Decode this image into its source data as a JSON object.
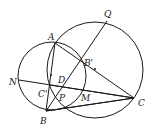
{
  "diagram": {
    "type": "geometry",
    "points": {
      "A": {
        "label": "A",
        "x": 55,
        "y": 43,
        "lx": 48,
        "ly": 40
      },
      "B": {
        "label": "B",
        "x": 46,
        "y": 111,
        "lx": 40,
        "ly": 123
      },
      "C": {
        "label": "C",
        "x": 134,
        "y": 98,
        "lx": 138,
        "ly": 105
      },
      "Q": {
        "label": "Q",
        "x": 107,
        "y": 21,
        "lx": 104,
        "ly": 17
      },
      "N": {
        "label": "N",
        "x": 19,
        "y": 80,
        "lx": 10,
        "ly": 84
      },
      "B_prime": {
        "label": "B'",
        "x": 82,
        "y": 60,
        "lx": 84,
        "ly": 65
      },
      "C_prime": {
        "label": "C'",
        "x": 50,
        "y": 85,
        "lx": 38,
        "ly": 96
      },
      "D": {
        "label": "D",
        "x": 56,
        "y": 79,
        "lx": 58,
        "ly": 83
      },
      "P": {
        "label": "P",
        "x": 58,
        "y": 96,
        "lx": 59,
        "ly": 100
      },
      "M": {
        "label": "M",
        "x": 80,
        "y": 94,
        "lx": 81,
        "ly": 100
      }
    },
    "circles": [
      {
        "name": "small-circle",
        "cx": 52,
        "cy": 76,
        "r": 34
      },
      {
        "name": "large-circle",
        "cx": 95,
        "cy": 70,
        "r": 48
      }
    ],
    "segments": [
      [
        "A",
        "B"
      ],
      [
        "A",
        "C"
      ],
      [
        "B",
        "C"
      ],
      [
        "N",
        "C"
      ],
      [
        "B",
        "Q"
      ],
      [
        "A",
        "P"
      ],
      [
        "B",
        "D"
      ]
    ]
  }
}
